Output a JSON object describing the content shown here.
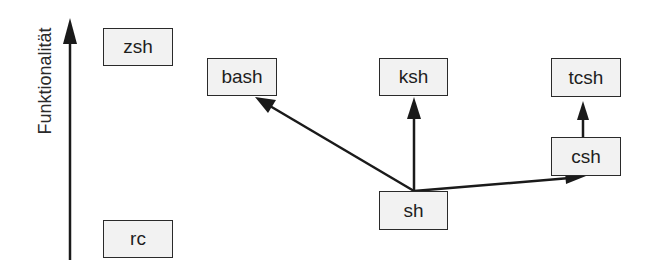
{
  "axis": {
    "label": "Funktionalität",
    "direction": "up"
  },
  "nodes": {
    "zsh": {
      "label": "zsh"
    },
    "rc": {
      "label": "rc"
    },
    "bash": {
      "label": "bash"
    },
    "ksh": {
      "label": "ksh"
    },
    "tcsh": {
      "label": "tcsh"
    },
    "csh": {
      "label": "csh"
    },
    "sh": {
      "label": "sh"
    }
  },
  "edges": [
    {
      "from": "sh",
      "to": "bash"
    },
    {
      "from": "sh",
      "to": "ksh"
    },
    {
      "from": "sh",
      "to": "csh"
    },
    {
      "from": "csh",
      "to": "tcsh"
    }
  ],
  "colors": {
    "stroke": "#1a1a1a",
    "box_fill": "#f2f2f2",
    "background": "#ffffff"
  }
}
